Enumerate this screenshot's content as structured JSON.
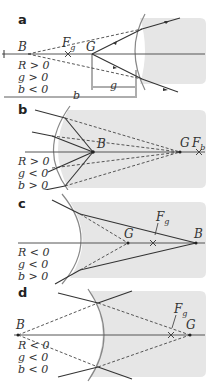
{
  "colors": {
    "medium": "#e6e6e6",
    "axis": "#555555",
    "ray": "#333333",
    "dashed": "#444444",
    "surface": "#888888",
    "text": "#333333"
  },
  "panels": [
    {
      "letter": "a",
      "points": {
        "B": "B",
        "F": "F",
        "F_sub": "g",
        "G": "G"
      },
      "conditions": [
        "R > 0",
        "g > 0",
        "b < 0"
      ],
      "dims": {
        "g": "g",
        "b": "b"
      }
    },
    {
      "letter": "b",
      "points": {
        "B": "B",
        "G": "G",
        "F": "F",
        "F_sub": "b"
      },
      "conditions": [
        "R > 0",
        "g < 0",
        "b > 0"
      ]
    },
    {
      "letter": "c",
      "points": {
        "G": "G",
        "F": "F",
        "F_sub": "g",
        "B": "B"
      },
      "conditions": [
        "R < 0",
        "g < 0",
        "b > 0"
      ]
    },
    {
      "letter": "d",
      "points": {
        "B": "B",
        "F": "F",
        "F_sub": "g",
        "G": "G"
      },
      "conditions": [
        "R < 0",
        "g < 0",
        "b < 0"
      ]
    }
  ]
}
